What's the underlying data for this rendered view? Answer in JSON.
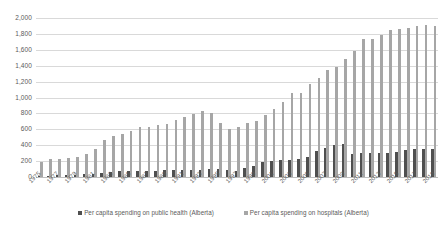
{
  "chart_data": {
    "type": "bar",
    "title": "",
    "xlabel": "",
    "ylabel": "",
    "ylim": [
      0,
      2000
    ],
    "ytick_step": 200,
    "ytick_labels": [
      "0",
      "200",
      "400",
      "600",
      "800",
      "1,000",
      "1,200",
      "1,400",
      "1,600",
      "1,800",
      "2,000"
    ],
    "grid": true,
    "legend_position": "bottom",
    "xtick_label_every": 2,
    "categories": [
      "1975",
      "1976",
      "1977",
      "1978",
      "1979",
      "1980",
      "1981",
      "1982",
      "1983",
      "1984",
      "1985",
      "1986",
      "1987",
      "1988",
      "1989",
      "1990",
      "1991",
      "1992",
      "1993",
      "1994",
      "1995",
      "1996",
      "1997",
      "1998",
      "1999",
      "2000",
      "2001",
      "2002",
      "2003",
      "2004",
      "2005",
      "2006",
      "2007",
      "2008",
      "2009",
      "2010",
      "2011",
      "2012",
      "2013",
      "2014",
      "2015",
      "2016",
      "2017",
      "2018",
      "2019"
    ],
    "series": [
      {
        "name": "Per capita spending on public health (Alberta)",
        "color": "#4f4f4f",
        "values": [
          10,
          18,
          22,
          25,
          30,
          36,
          42,
          50,
          62,
          70,
          72,
          75,
          78,
          80,
          82,
          85,
          88,
          90,
          92,
          95,
          100,
          82,
          80,
          112,
          140,
          185,
          200,
          210,
          215,
          222,
          255,
          330,
          365,
          405,
          415,
          290,
          300,
          302,
          305,
          308,
          320,
          340,
          350,
          355,
          358
        ]
      },
      {
        "name": "Per capita spending on hospitals (Alberta)",
        "color": "#a6a6a6",
        "values": [
          195,
          225,
          232,
          236,
          248,
          290,
          355,
          460,
          520,
          545,
          580,
          625,
          635,
          648,
          672,
          718,
          760,
          795,
          828,
          805,
          680,
          605,
          625,
          680,
          710,
          780,
          850,
          945,
          1055,
          1062,
          1165,
          1250,
          1340,
          1380,
          1490,
          1580,
          1735,
          1730,
          1790,
          1855,
          1865,
          1870,
          1895,
          1910,
          1905
        ]
      }
    ]
  },
  "legend": {
    "items": [
      {
        "label": "Per capita spending on public health (Alberta)",
        "marker": "square-marker-icon"
      },
      {
        "label": "Per capita spending on hospitals (Alberta)",
        "marker": "square-marker-icon"
      }
    ]
  }
}
